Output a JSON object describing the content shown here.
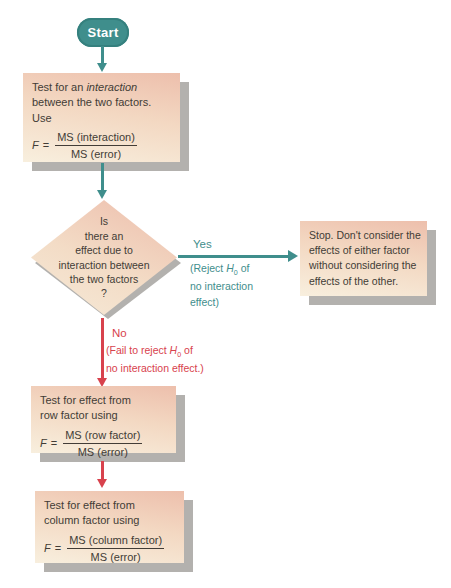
{
  "colors": {
    "teal": "#3f8e8c",
    "red": "#d8424d",
    "box_gradient_top": "#edbfac",
    "box_gradient_bottom": "#f8efde",
    "shadow_gray": "#b3b1ae",
    "text": "#423c36"
  },
  "start": {
    "label": "Start"
  },
  "box1": {
    "lines": [
      [
        {
          "t": "Test for an "
        },
        {
          "t": "interaction",
          "i": true
        }
      ],
      [
        {
          "t": "between the two factors."
        }
      ],
      [
        {
          "t": "Use"
        }
      ]
    ],
    "formula": {
      "lhs": "F",
      "eq": "=",
      "num": "MS (interaction)",
      "den": "MS (error)"
    }
  },
  "diamond": {
    "lines": [
      "Is",
      "there an",
      "effect due to",
      "interaction between",
      "the two factors",
      "?"
    ]
  },
  "yes_branch": {
    "label": "Yes",
    "caption": [
      [
        {
          "t": "(Reject "
        },
        {
          "t": "H",
          "i": true
        },
        {
          "t": "0",
          "sub": true
        },
        {
          "t": " of"
        }
      ],
      [
        {
          "t": "no interaction"
        }
      ],
      [
        {
          "t": "effect)"
        }
      ]
    ]
  },
  "stop_box": {
    "lines": [
      "Stop. Don't consider the",
      "effects of either factor",
      "without considering the",
      "effects of the other."
    ]
  },
  "no_branch": {
    "label": "No",
    "caption": [
      [
        {
          "t": "(Fail to reject "
        },
        {
          "t": "H",
          "i": true
        },
        {
          "t": "0",
          "sub": true
        },
        {
          "t": " of"
        }
      ],
      [
        {
          "t": "no interaction effect.)"
        }
      ]
    ]
  },
  "row_box": {
    "lines": [
      "Test for effect from",
      "row factor using"
    ],
    "formula": {
      "lhs": "F",
      "eq": "=",
      "num": "MS (row factor)",
      "den": "MS (error)"
    }
  },
  "column_box": {
    "lines": [
      "Test for effect from",
      "column factor using"
    ],
    "formula": {
      "lhs": "F",
      "eq": "=",
      "num": "MS (column factor)",
      "den": "MS (error)"
    }
  }
}
